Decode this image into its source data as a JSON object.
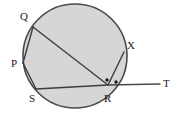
{
  "figure": {
    "type": "euclidean-geometry-diagram",
    "canvas": {
      "width": 176,
      "height": 116
    },
    "colors": {
      "background": "#ffffff",
      "circle_fill": "#d6d6d6",
      "stroke": "#4a4a4a",
      "chord_stroke": "#3d3d3d",
      "label_color": "#1a1a1a",
      "dot_color": "#1a1a1a"
    },
    "circle": {
      "cx": 75,
      "cy": 56,
      "r": 52,
      "stroke_width": 1.6
    },
    "points": [
      {
        "id": "Q",
        "label": "Q",
        "x": 33,
        "y": 27,
        "label_x": 20,
        "label_y": 11
      },
      {
        "id": "P",
        "label": "P",
        "x": 23,
        "y": 63,
        "label_x": 11,
        "label_y": 58
      },
      {
        "id": "S",
        "label": "S",
        "x": 36,
        "y": 89,
        "label_x": 29,
        "label_y": 93
      },
      {
        "id": "R",
        "label": "R",
        "x": 108,
        "y": 85,
        "label_x": 104,
        "label_y": 93
      },
      {
        "id": "X",
        "label": "X",
        "x": 124,
        "y": 52,
        "label_x": 127,
        "label_y": 40
      },
      {
        "id": "T",
        "label": "T",
        "x": 160,
        "y": 84,
        "label_x": 163,
        "label_y": 78
      }
    ],
    "segments": [
      {
        "id": "QR",
        "from": "Q",
        "to": "R",
        "kind": "chord",
        "x1": 33,
        "y1": 27,
        "x2": 108,
        "y2": 85
      },
      {
        "id": "QP",
        "from": "Q",
        "to": "P",
        "kind": "chord",
        "x1": 33,
        "y1": 27,
        "x2": 23,
        "y2": 63
      },
      {
        "id": "PS",
        "from": "P",
        "to": "S",
        "kind": "chord",
        "x1": 23,
        "y1": 63,
        "x2": 36,
        "y2": 89
      },
      {
        "id": "SR",
        "from": "S",
        "to": "R",
        "kind": "chord",
        "x1": 36,
        "y1": 89,
        "x2": 108,
        "y2": 85
      },
      {
        "id": "RX",
        "from": "R",
        "to": "X",
        "kind": "chord",
        "x1": 108,
        "y1": 85,
        "x2": 124,
        "y2": 52
      },
      {
        "id": "RT",
        "from": "R",
        "to": "T",
        "kind": "tangent",
        "x1": 108,
        "y1": 85,
        "x2": 160,
        "y2": 84
      }
    ],
    "angle_markers": [
      {
        "id": "angle-dot-left",
        "x": 107,
        "y": 80,
        "r": 1.7
      },
      {
        "id": "angle-dot-right",
        "x": 116,
        "y": 82,
        "r": 1.7
      }
    ]
  }
}
